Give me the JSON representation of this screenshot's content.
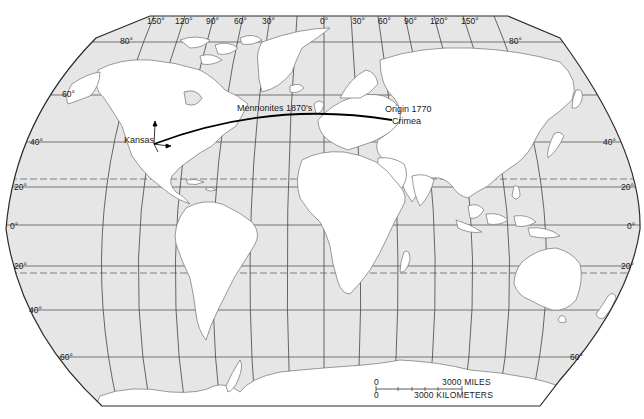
{
  "map": {
    "projection": "Robinson-like world map",
    "colors": {
      "ocean": "#e6e6e6",
      "land": "#ffffff",
      "coast": "#6e6e6e",
      "grid": "#4a4a4a",
      "border": "#2a2a2a",
      "route": "#000000",
      "text": "#1a1a1a"
    },
    "longitude_labels": [
      "150°",
      "120°",
      "90°",
      "60°",
      "30°",
      "0°",
      "30°",
      "60°",
      "90°",
      "120°",
      "150°"
    ],
    "latitude_labels_left": [
      "80°",
      "60°",
      "40°",
      "20°",
      "0°",
      "20°",
      "40°",
      "60°"
    ],
    "latitude_labels_right": [
      "80°",
      "40°",
      "20°",
      "0°",
      "20°",
      "60°"
    ],
    "tropics": [
      "Tropic of Cancer (dashed)",
      "Tropic of Capricorn (dashed)"
    ]
  },
  "migration": {
    "route_label": "Mennonites 1870's",
    "origin_line1": "Origin  1770",
    "origin_line2": "Crimea",
    "destination": "Kansas"
  },
  "scale_bar": {
    "miles_zero": "0",
    "miles_label": "3000  MILES",
    "km_zero": "0",
    "km_label": "3000  KILOMETERS"
  }
}
